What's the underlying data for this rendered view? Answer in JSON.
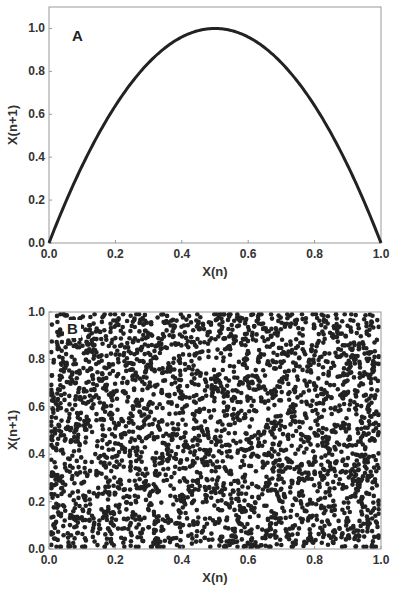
{
  "chart_data": [
    {
      "type": "line",
      "panel_label": "A",
      "title": "",
      "xlabel": "X(n)",
      "ylabel": "X(n+1)",
      "xlim": [
        0.0,
        1.0
      ],
      "ylim": [
        0.0,
        1.1
      ],
      "xticks": [
        "0.0",
        "0.2",
        "0.4",
        "0.6",
        "0.8",
        "1.0"
      ],
      "yticks": [
        "0.0",
        "0.2",
        "0.4",
        "0.6",
        "0.8",
        "1.0"
      ],
      "grid": false,
      "legend": null,
      "series": [
        {
          "name": "logistic map X(n+1) = 4·X(n)·(1−X(n))",
          "x": [
            0.0,
            0.05,
            0.1,
            0.15,
            0.2,
            0.25,
            0.3,
            0.35,
            0.4,
            0.45,
            0.5,
            0.55,
            0.6,
            0.65,
            0.7,
            0.75,
            0.8,
            0.85,
            0.9,
            0.95,
            1.0
          ],
          "y": [
            0.0,
            0.19,
            0.36,
            0.51,
            0.64,
            0.75,
            0.84,
            0.91,
            0.96,
            0.99,
            1.0,
            0.99,
            0.96,
            0.91,
            0.84,
            0.75,
            0.64,
            0.51,
            0.36,
            0.19,
            0.0
          ],
          "color": "#222222"
        }
      ]
    },
    {
      "type": "scatter",
      "panel_label": "B",
      "title": "",
      "xlabel": "X(n)",
      "ylabel": "X(n+1)",
      "xlim": [
        0.0,
        1.0
      ],
      "ylim": [
        0.0,
        1.0
      ],
      "xticks": [
        "0.0",
        "0.2",
        "0.4",
        "0.6",
        "0.8",
        "1.0"
      ],
      "yticks": [
        "0.0",
        "0.2",
        "0.4",
        "0.6",
        "0.8",
        "1.0"
      ],
      "grid": false,
      "legend": null,
      "series": [
        {
          "name": "random points (uniform over unit square)",
          "approx_point_count": 3000,
          "distribution": "uniform, no structure",
          "color": "#222222"
        }
      ]
    }
  ],
  "render": {
    "scatter_count": 3000,
    "scatter_seed": 12345,
    "marker_radius": 2.3
  },
  "colors": {
    "curve": "#222222",
    "points": "#222222",
    "frame": "#999999",
    "text": "#333333"
  }
}
